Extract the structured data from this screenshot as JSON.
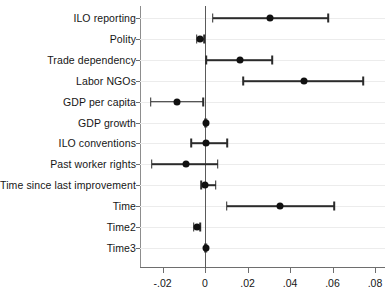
{
  "chart_data": {
    "type": "scatter",
    "subtype": "coefficient-plot",
    "title": "",
    "xlabel": "",
    "ylabel": "",
    "xlim": [
      -0.0306,
      0.0847
    ],
    "xticks": [
      -0.02,
      0,
      0.02,
      0.04,
      0.06,
      0.08
    ],
    "xticklabels": [
      "-.02",
      "0",
      ".02",
      ".04",
      ".06",
      ".08"
    ],
    "grid": "horizontal",
    "legend": "none",
    "reference_line": 0,
    "categories": [
      "ILO reporting",
      "Polity",
      "Trade dependency",
      "Labor NGOs",
      "GDP per capita",
      "GDP growth",
      "ILO conventions",
      "Past worker rights",
      "Time since last improvement",
      "Time",
      "Time2",
      "Time3"
    ],
    "points": [
      {
        "label": "ILO reporting",
        "estimate": 0.0306,
        "ci_low": 0.0036,
        "ci_high": 0.058
      },
      {
        "label": "Polity",
        "estimate": -0.0024,
        "ci_low": -0.0039,
        "ci_high": -0.0005
      },
      {
        "label": "Trade dependency",
        "estimate": 0.0165,
        "ci_low": 0.0005,
        "ci_high": 0.0316
      },
      {
        "label": "Labor NGOs",
        "estimate": 0.0465,
        "ci_low": 0.018,
        "ci_high": 0.0745
      },
      {
        "label": "GDP per capita",
        "estimate": -0.0133,
        "ci_low": -0.0256,
        "ci_high": -0.0008
      },
      {
        "label": "GDP growth",
        "estimate": 0.0004,
        "ci_low": 0.0,
        "ci_high": 0.0008
      },
      {
        "label": "ILO conventions",
        "estimate": 0.0006,
        "ci_low": -0.0066,
        "ci_high": 0.0105
      },
      {
        "label": "Past worker rights",
        "estimate": -0.0089,
        "ci_low": -0.0251,
        "ci_high": 0.006
      },
      {
        "label": "Time since last improvement",
        "estimate": 0.0002,
        "ci_low": -0.0019,
        "ci_high": 0.005
      },
      {
        "label": "Time",
        "estimate": 0.0353,
        "ci_low": 0.0102,
        "ci_high": 0.0607
      },
      {
        "label": "Time2",
        "estimate": -0.0039,
        "ci_low": -0.0053,
        "ci_high": -0.0024
      },
      {
        "label": "Time3",
        "estimate": 0.0005,
        "ci_low": 0.0002,
        "ci_high": 0.0008
      }
    ],
    "colors": {
      "marker": "#111111",
      "ci": "#2b2b2b",
      "zero_line": "#5a5a5a",
      "grid": "#ececec",
      "axis": "#6e6e6e",
      "background": "#ffffff",
      "text": "#161616"
    }
  }
}
